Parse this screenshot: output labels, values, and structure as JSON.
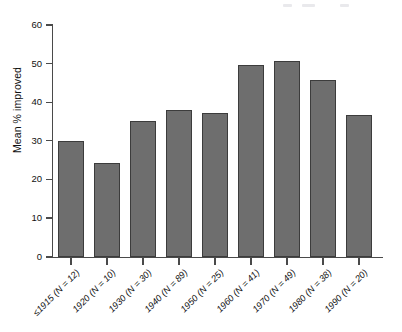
{
  "chart_data": {
    "type": "bar",
    "title": "",
    "xlabel": "",
    "ylabel": "Mean % improved",
    "ylim": [
      0,
      60
    ],
    "yticks": [
      0,
      10,
      20,
      30,
      40,
      50,
      60
    ],
    "ytick_labels": [
      "0",
      "10",
      "20",
      "30",
      "40",
      "50",
      "60"
    ],
    "grid": false,
    "legend": false,
    "bar_color": "#6e6e6e",
    "bar_edge_color": "#3c3c3c",
    "categories": [
      "≤1915 (N = 12)",
      "1920 (N = 10)",
      "1930 (N = 30)",
      "1940 (N = 89)",
      "1950 (N = 25)",
      "1960 (N = 41)",
      "1970 (N = 49)",
      "1980 (N = 38)",
      "1990 (N = 20)"
    ],
    "values": [
      30.0,
      24.3,
      35.2,
      37.9,
      37.1,
      49.7,
      50.7,
      45.7,
      36.6
    ],
    "decade_labels": [
      "≤1915",
      "1920",
      "1930",
      "1940",
      "1950",
      "1960",
      "1970",
      "1980",
      "1990"
    ],
    "sample_sizes": [
      12,
      10,
      30,
      89,
      25,
      41,
      49,
      38,
      20
    ]
  }
}
